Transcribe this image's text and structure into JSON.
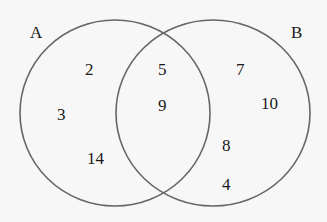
{
  "diagram": {
    "type": "venn",
    "sets": [
      {
        "label": "A",
        "only": [
          "2",
          "3",
          "14"
        ]
      },
      {
        "label": "B",
        "only": [
          "7",
          "10",
          "8",
          "4"
        ]
      }
    ],
    "intersection": [
      "5",
      "9"
    ],
    "colors": {
      "stroke": "#666666",
      "background": "#f7f7f7",
      "text": "#1a1a1a"
    }
  }
}
